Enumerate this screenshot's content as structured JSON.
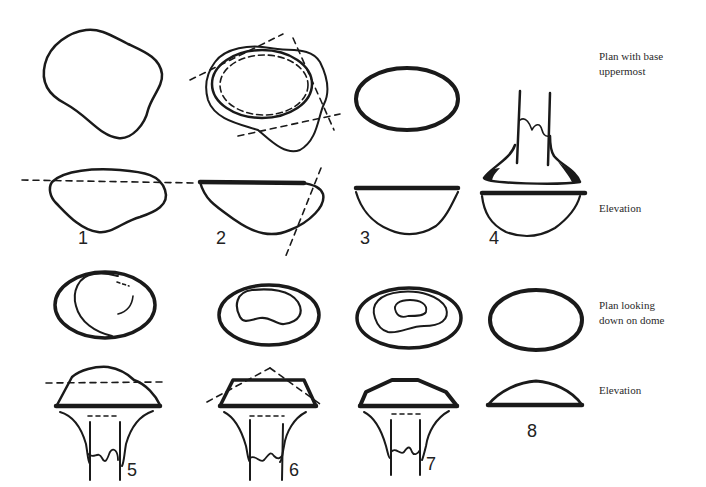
{
  "row_labels": {
    "plan_base_line1": "Plan with base",
    "plan_base_line2": "uppermost",
    "elevation_top": "Elevation",
    "plan_dome_line1": "Plan looking",
    "plan_dome_line2": "down on dome",
    "elevation_bottom": "Elevation"
  },
  "figure_numbers": [
    "1",
    "2",
    "3",
    "4",
    "5",
    "6",
    "7",
    "8"
  ],
  "colors": {
    "ink": "#1a1a1a",
    "paper": "#ffffff"
  }
}
